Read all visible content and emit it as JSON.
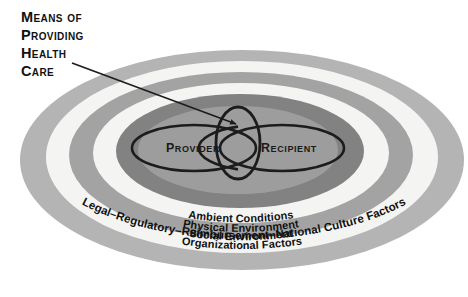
{
  "figure": {
    "title_lines": [
      "Means of",
      "Providing",
      "Health",
      "Care"
    ],
    "callout": {
      "name": "title-pointer-arrow",
      "from": [
        93,
        63
      ],
      "to": [
        238,
        125
      ]
    }
  },
  "colors": {
    "ring_mid_gray": "#a3a3a3",
    "ring_dark_gray": "#828282",
    "ring_light_gray": "#b4b4b4",
    "ring_white": "#f4f4f2",
    "core_fill": "#9d9d9d",
    "node_fill": "#d8d8d6",
    "outline": "#1c1c1c",
    "text": "#111111",
    "page_background": "#ffffff"
  },
  "rings": [
    {
      "id": "ring-legal-regulatory",
      "label": "Legal–Regulatory–Reimbursement–National Culture Factors",
      "level": 5,
      "band_color": "#b4b4b4",
      "rx": 222,
      "ry": 110
    },
    {
      "id": "ring-organizational-factors",
      "label": "Organizational Factors",
      "level": 4,
      "band_color": "#f4f4f2",
      "rx": 196,
      "ry": 96
    },
    {
      "id": "ring-social-environment",
      "label": "Social Environment",
      "level": 3,
      "band_color": "#a3a3a3",
      "rx": 172,
      "ry": 83
    },
    {
      "id": "ring-physical-environment",
      "label": "Physical Environment",
      "level": 2,
      "band_color": "#f4f4f2",
      "rx": 148,
      "ry": 70
    },
    {
      "id": "ring-ambient-conditions",
      "label": "Ambient Conditions",
      "level": 1,
      "band_color": "#828282",
      "rx": 124,
      "ry": 57
    }
  ],
  "core": {
    "id": "core-ellipse",
    "fill": "#9d9d9d",
    "rx": 100,
    "ry": 44
  },
  "nodes": [
    {
      "id": "node-provider",
      "label": "Provider",
      "cx": 194,
      "cy": 148,
      "rx": 62,
      "ry": 23
    },
    {
      "id": "node-recipient",
      "label": "Recipient",
      "cx": 282,
      "cy": 148,
      "rx": 62,
      "ry": 23
    }
  ],
  "interaction_ellipse": {
    "id": "node-interaction",
    "cx": 238,
    "cy": 143,
    "rx": 22,
    "ry": 36
  }
}
